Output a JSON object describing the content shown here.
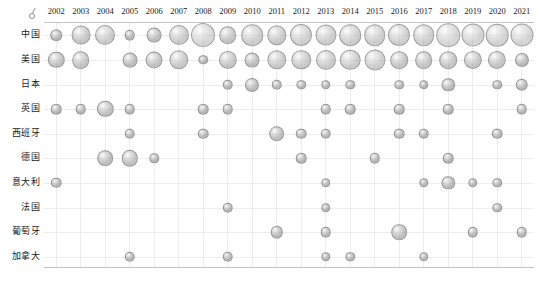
{
  "chart_data": {
    "type": "scatter",
    "title": "",
    "subtitle": "",
    "xlabel": "",
    "ylabel": "",
    "grid": true,
    "legend_position": "none",
    "bubble_encoding": "marker area proportional to value",
    "origin_marker": "small-circle-tick-glyph",
    "categories": [
      "2002",
      "2003",
      "2004",
      "2005",
      "2006",
      "2007",
      "2008",
      "2009",
      "2010",
      "2011",
      "2012",
      "2013",
      "2014",
      "2015",
      "2016",
      "2017",
      "2018",
      "2019",
      "2020",
      "2021"
    ],
    "rows": [
      "中国",
      "美国",
      "日本",
      "英国",
      "西班牙",
      "德国",
      "意大利",
      "法国",
      "葡萄牙",
      "加拿大"
    ],
    "series": [
      {
        "name": "中国",
        "values": [
          3,
          8,
          9,
          2.5,
          5,
          9,
          13,
          7,
          10.5,
          8.5,
          11,
          10,
          10.5,
          10.5,
          11,
          10.5,
          12.5,
          12,
          11.5,
          12
        ]
      },
      {
        "name": "美国",
        "values": [
          6,
          7,
          0,
          5,
          6.5,
          8.5,
          2,
          7.5,
          5,
          8.5,
          8.5,
          9,
          9.5,
          10,
          7,
          7,
          7,
          7.5,
          7.5,
          4.5
        ]
      },
      {
        "name": "日本",
        "values": [
          0,
          0,
          0,
          0,
          0,
          0,
          0,
          2.5,
          4.5,
          2.5,
          2,
          2,
          2,
          0,
          2,
          2,
          4,
          0,
          2,
          3.5
        ]
      },
      {
        "name": "英国",
        "values": [
          2.5,
          2.5,
          6,
          2.5,
          0,
          0,
          2.5,
          2.5,
          0,
          0,
          0,
          2.5,
          2.5,
          0,
          2.5,
          0,
          2.5,
          0,
          0,
          2.5
        ]
      },
      {
        "name": "西班牙",
        "values": [
          0,
          0,
          0,
          2.5,
          0,
          0,
          2.5,
          0,
          0,
          5.5,
          2.5,
          2.5,
          0,
          0,
          2.5,
          2.5,
          0,
          0,
          2.5,
          0
        ]
      },
      {
        "name": "德国",
        "values": [
          0,
          0,
          5.5,
          6,
          2,
          0,
          0,
          0,
          0,
          0,
          2.5,
          0,
          0,
          2.5,
          0,
          0,
          2.5,
          0,
          0,
          0
        ]
      },
      {
        "name": "意大利",
        "values": [
          2.5,
          0,
          0,
          0,
          0,
          0,
          0,
          0,
          0,
          0,
          0,
          2,
          0,
          0,
          0,
          2,
          4,
          2,
          2,
          0
        ]
      },
      {
        "name": "法国",
        "values": [
          0,
          0,
          0,
          0,
          0,
          0,
          0,
          2.5,
          0,
          0,
          0,
          2,
          0,
          0,
          0,
          0,
          0,
          0,
          2,
          0
        ]
      },
      {
        "name": "葡萄牙",
        "values": [
          0,
          0,
          0,
          0,
          0,
          0,
          0,
          0,
          0,
          3.5,
          0,
          2.5,
          0,
          0,
          5.5,
          0,
          0,
          2.5,
          0,
          2.5
        ]
      },
      {
        "name": "加拿大",
        "values": [
          0,
          0,
          0,
          2.5,
          0,
          0,
          0,
          2.5,
          0,
          0,
          0,
          2,
          2,
          0,
          0,
          2,
          0,
          0,
          0,
          0
        ]
      }
    ]
  },
  "style": {
    "bubble_fill": "#8c8c8c",
    "bubble_stroke": "#787878",
    "grid_color": "#ededed",
    "frame_color": "#c4c4c4",
    "text_color": "#1a1a1a",
    "background": "#ffffff"
  }
}
